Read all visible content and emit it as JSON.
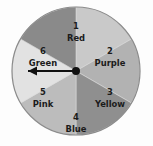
{
  "figure": {
    "name": "spinner-wheel",
    "background_color": "#fdfdfd",
    "outline_color": "#8c8c8c"
  },
  "wheel": {
    "center_x": 76,
    "center_y": 71,
    "radius": 64,
    "sector_count": 6,
    "sector_angle_degrees": 60,
    "sectors": [
      {
        "number": "1",
        "name": "Red",
        "fill": "#c9c9c9",
        "start_angle": -90,
        "end_angle": -30,
        "label_x": 76,
        "label_y": 26
      },
      {
        "number": "2",
        "name": "Purple",
        "fill": "#b2b2b2",
        "start_angle": -30,
        "end_angle": 30,
        "label_x": 110,
        "label_y": 51
      },
      {
        "number": "3",
        "name": "Yellow",
        "fill": "#8f8f8f",
        "start_angle": 30,
        "end_angle": 90,
        "label_x": 110,
        "label_y": 92
      },
      {
        "number": "4",
        "name": "Blue",
        "fill": "#bcbcbc",
        "start_angle": 90,
        "end_angle": 150,
        "label_x": 76,
        "label_y": 117
      },
      {
        "number": "5",
        "name": "Pink",
        "fill": "#e2e2e2",
        "start_angle": 150,
        "end_angle": 210,
        "label_x": 43,
        "label_y": 92
      },
      {
        "number": "6",
        "name": "Green",
        "fill": "#8a8a8a",
        "start_angle": 210,
        "end_angle": 270,
        "label_x": 43,
        "label_y": 51
      }
    ]
  },
  "pointer": {
    "name": "spinner-arrow",
    "color": "#111111",
    "direction": "left",
    "angle_degrees": 180,
    "length": 48,
    "pivot_radius": 4
  }
}
